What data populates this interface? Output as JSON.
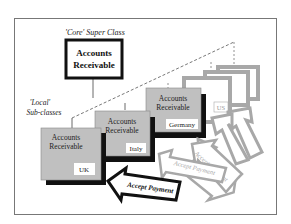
{
  "diagram": {
    "core_label": "'Core' Super Class",
    "core_box": {
      "line1": "Accounts",
      "line2": "Receivable"
    },
    "local_label": {
      "line1": "'Local'",
      "line2": "Sub-classes"
    },
    "subclasses": [
      {
        "line1": "Accounts",
        "line2": "Receivable",
        "country": "UK"
      },
      {
        "line1": "Accounts",
        "line2": "Receivable",
        "country": "Italy"
      },
      {
        "line1": "Accounts",
        "line2": "Receivable",
        "country": "Germany"
      },
      {
        "country": "US"
      },
      {
        "country": "France"
      }
    ],
    "arrows": [
      {
        "label": "Accept Payment",
        "emphasis": "primary"
      },
      {
        "label": "Accept Payment",
        "emphasis": "faded"
      },
      {
        "label": "Accept Payment",
        "emphasis": "faded"
      }
    ],
    "colors": {
      "box_fill": "#c0c0c0",
      "shadow": "#111111",
      "faded": "#a8a8a8",
      "frame": "#777777"
    }
  }
}
